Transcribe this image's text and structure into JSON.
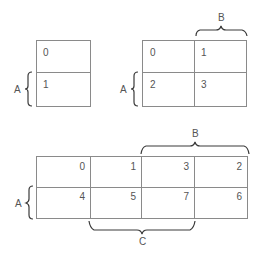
{
  "diagram": {
    "type": "karnaugh-maps",
    "colors": {
      "grid": "#8a8a8a",
      "brace": "#3a3a3a",
      "text": "#555555",
      "background": "#ffffff"
    },
    "map1": {
      "variables": 1,
      "cells": [
        "0",
        "1"
      ],
      "labels": {
        "A": "A"
      }
    },
    "map2": {
      "variables": 2,
      "cells": [
        "0",
        "1",
        "2",
        "3"
      ],
      "labels": {
        "A": "A",
        "B": "B"
      }
    },
    "map3": {
      "variables": 3,
      "cells": [
        "0",
        "1",
        "3",
        "2",
        "4",
        "5",
        "7",
        "6"
      ],
      "labels": {
        "A": "A",
        "B": "B",
        "C": "C"
      }
    }
  }
}
